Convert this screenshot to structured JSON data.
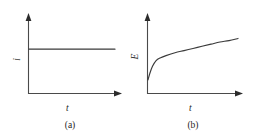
{
  "figure": {
    "background_color": "#ffffff",
    "ink_color": "#3a3a3a",
    "panels": [
      {
        "id": "a",
        "caption": "(a)",
        "ylabel": "i",
        "xlabel": "t",
        "description": "constant current held flat versus time"
      },
      {
        "id": "b",
        "caption": "(b)",
        "ylabel": "E",
        "xlabel": "t",
        "description": "potential rises steeply then increases gradually versus time"
      }
    ]
  },
  "chart_data": [
    {
      "type": "line",
      "panel": "a",
      "title": "(a)",
      "xlabel": "t",
      "ylabel": "i",
      "grid": false,
      "legend": null,
      "axis_style": "arrowed",
      "xlim": [
        0,
        1
      ],
      "ylim": [
        0,
        1
      ],
      "tick_labels": {
        "x": [],
        "y": []
      },
      "series": [
        {
          "name": "i",
          "x": [
            0.0,
            0.1,
            0.2,
            0.3,
            0.4,
            0.5,
            0.6,
            0.7,
            0.8,
            0.9,
            1.0
          ],
          "values": [
            0.62,
            0.62,
            0.62,
            0.62,
            0.62,
            0.62,
            0.62,
            0.62,
            0.62,
            0.62,
            0.62
          ]
        }
      ]
    },
    {
      "type": "line",
      "panel": "b",
      "title": "(b)",
      "xlabel": "t",
      "ylabel": "E",
      "grid": false,
      "legend": null,
      "axis_style": "arrowed",
      "xlim": [
        0,
        1
      ],
      "ylim": [
        0,
        1
      ],
      "tick_labels": {
        "x": [],
        "y": []
      },
      "series": [
        {
          "name": "E",
          "x": [
            0.0,
            0.02,
            0.05,
            0.09,
            0.14,
            0.2,
            0.3,
            0.4,
            0.5,
            0.6,
            0.7,
            0.8,
            0.9,
            1.0
          ],
          "values": [
            0.19,
            0.28,
            0.38,
            0.46,
            0.5,
            0.53,
            0.57,
            0.6,
            0.63,
            0.66,
            0.69,
            0.72,
            0.74,
            0.77
          ]
        }
      ]
    }
  ]
}
